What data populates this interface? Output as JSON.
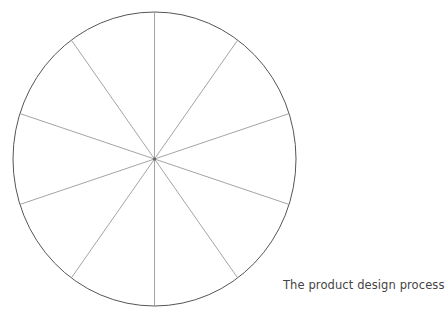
{
  "diagram": {
    "caption": "The product design process",
    "wheel": {
      "segments": 10,
      "center": [
        154.5,
        159
      ],
      "radius_x": 141.5,
      "radius_y": 147,
      "start_angle_deg": -90,
      "outline_color": "#555555",
      "spoke_color": "#9a9a9a",
      "hub_color": "#666666"
    }
  }
}
